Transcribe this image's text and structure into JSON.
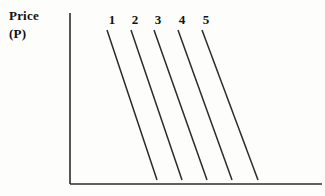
{
  "figure": {
    "type": "economics-diagram",
    "background_color": "#fdfdfc",
    "ink_color": "#2b2b2b"
  },
  "axes": {
    "y_axis": {
      "label_line1": "Price",
      "label_line2": "(P)",
      "x": 70,
      "y_top": 13,
      "y_bottom": 184
    },
    "x_axis": {
      "label": "",
      "y": 184,
      "x_left": 70,
      "x_right": 322
    }
  },
  "chart_data": {
    "type": "line",
    "title": "",
    "xlabel": "",
    "ylabel": "Price (P)",
    "grid": false,
    "legend": "inline-top-labels",
    "series": [
      {
        "name": "1",
        "label_x": 105,
        "x1": 107,
        "y1": 30,
        "x2": 157,
        "y2": 180
      },
      {
        "name": "2",
        "label_x": 128,
        "x1": 131,
        "y1": 30,
        "x2": 182,
        "y2": 180
      },
      {
        "name": "3",
        "label_x": 151,
        "x1": 154,
        "y1": 30,
        "x2": 207,
        "y2": 180
      },
      {
        "name": "4",
        "label_x": 175,
        "x1": 178,
        "y1": 30,
        "x2": 232,
        "y2": 180
      },
      {
        "name": "5",
        "label_x": 199,
        "x1": 202,
        "y1": 30,
        "x2": 258,
        "y2": 180
      }
    ]
  }
}
